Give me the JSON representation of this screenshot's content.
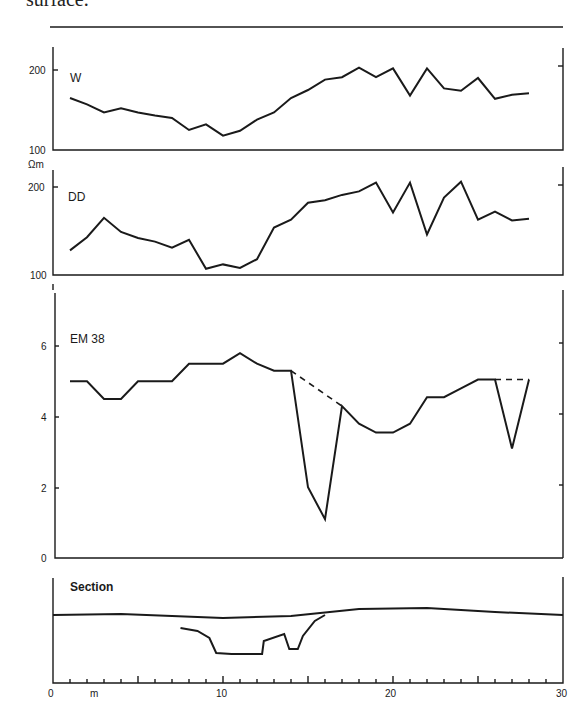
{
  "caption": "surface.",
  "chart_data": [
    {
      "type": "line",
      "panel": "W",
      "title": "W",
      "ylabel": "",
      "ylim": [
        100,
        220
      ],
      "yticks": [
        100,
        200
      ],
      "x": [
        1,
        2,
        3,
        4,
        5,
        6,
        7,
        8,
        9,
        10,
        11,
        12,
        13,
        14,
        15,
        16,
        17,
        18,
        19,
        20,
        21,
        22,
        23,
        24,
        25,
        26,
        27,
        28
      ],
      "values": [
        165,
        157,
        147,
        152,
        147,
        143,
        140,
        125,
        132,
        118,
        124,
        138,
        147,
        165,
        175,
        188,
        191,
        203,
        191,
        202,
        168,
        202,
        177,
        174,
        190,
        164,
        169,
        171
      ]
    },
    {
      "type": "line",
      "panel": "DD",
      "title": "DD",
      "ylabel": "Ωm",
      "ylim": [
        100,
        220
      ],
      "yticks": [
        100,
        200
      ],
      "x": [
        1,
        2,
        3,
        4,
        5,
        6,
        7,
        8,
        9,
        10,
        11,
        12,
        13,
        14,
        15,
        16,
        17,
        18,
        19,
        20,
        21,
        22,
        23,
        24,
        25,
        26,
        27,
        28
      ],
      "values": [
        128,
        143,
        165,
        149,
        142,
        138,
        131,
        140,
        107,
        112,
        108,
        118,
        154,
        163,
        182,
        185,
        191,
        195,
        205,
        171,
        205,
        146,
        188,
        206,
        163,
        172,
        162,
        164
      ]
    },
    {
      "type": "line",
      "panel": "EM38",
      "title": "EM 38",
      "ylabel": "",
      "ylim": [
        0,
        7.5
      ],
      "yticks": [
        0,
        2,
        4,
        6
      ],
      "x": [
        1,
        2,
        3,
        4,
        5,
        6,
        7,
        8,
        9,
        10,
        11,
        12,
        13,
        14,
        15,
        16,
        17,
        18,
        19,
        20,
        21,
        22,
        23,
        24,
        25,
        26,
        27,
        28
      ],
      "values": [
        5.0,
        5.0,
        4.5,
        4.5,
        5.0,
        5.0,
        5.0,
        5.5,
        5.5,
        5.5,
        5.8,
        5.5,
        5.3,
        5.3,
        2.0,
        1.1,
        4.3,
        3.8,
        3.55,
        3.55,
        3.8,
        4.55,
        4.55,
        4.8,
        5.05,
        5.05,
        3.1,
        5.05
      ],
      "dashed_segments": [
        {
          "from": [
            14,
            5.3
          ],
          "to": [
            17,
            4.3
          ]
        },
        {
          "from": [
            26,
            5.05
          ],
          "to": [
            28,
            5.05
          ]
        }
      ]
    },
    {
      "type": "line",
      "panel": "Section",
      "title": "Section",
      "xlabel": "m",
      "xlim": [
        0,
        30
      ],
      "xticks": [
        0,
        10,
        20,
        30
      ],
      "minor_tick_step": 1,
      "ground_surface": [
        [
          0,
          0.0
        ],
        [
          4,
          -0.1
        ],
        [
          10,
          0.3
        ],
        [
          14,
          0.1
        ],
        [
          18,
          -0.6
        ],
        [
          22,
          -0.7
        ],
        [
          26,
          -0.3
        ],
        [
          30,
          0.0
        ]
      ],
      "feature_profile": [
        [
          7.5,
          1.3
        ],
        [
          8.5,
          1.6
        ],
        [
          9.2,
          2.3
        ],
        [
          9.6,
          3.8
        ],
        [
          10.5,
          3.9
        ],
        [
          12.3,
          3.9
        ],
        [
          12.4,
          2.6
        ],
        [
          13.6,
          1.9
        ],
        [
          13.9,
          3.4
        ],
        [
          14.4,
          3.4
        ],
        [
          14.7,
          2.1
        ],
        [
          15.4,
          0.6
        ],
        [
          16.0,
          0.0
        ]
      ]
    }
  ],
  "panels": {
    "w": {
      "label": "W",
      "tick_top": "200",
      "tick_bottom": "100"
    },
    "dd": {
      "label": "DD",
      "unit": "Ωm",
      "tick_top": "200",
      "tick_bottom": "100"
    },
    "em38": {
      "label": "EM 38",
      "ticks": [
        "6",
        "4",
        "2",
        "0"
      ]
    },
    "section": {
      "label": "Section",
      "x_ticks": [
        "0",
        "10",
        "20",
        "30"
      ],
      "x_unit": "m"
    }
  },
  "colors": {
    "ink": "#1a1a1a",
    "background": "#ffffff"
  }
}
